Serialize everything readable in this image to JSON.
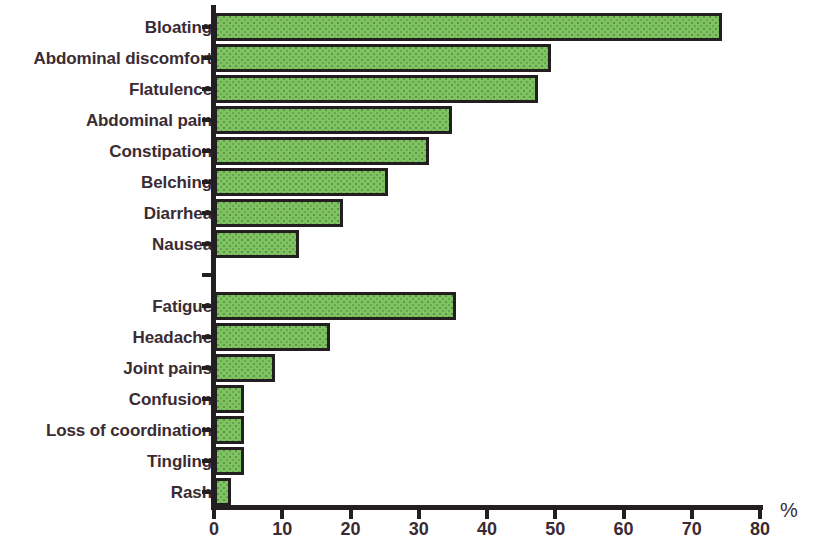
{
  "chart_data": {
    "type": "bar",
    "orientation": "horizontal",
    "title": "",
    "subtitle": "",
    "xlabel": "%",
    "ylabel": "",
    "xlim": [
      0,
      80
    ],
    "xticks": [
      0,
      10,
      20,
      30,
      40,
      50,
      60,
      70,
      80
    ],
    "xtick_labels": [
      "0",
      "10",
      "20",
      "30",
      "40",
      "50",
      "60",
      "70",
      "80"
    ],
    "grid": false,
    "legend": false,
    "bar_color": "#7ec261",
    "bar_edge_color": "#231f20",
    "label_color": "#3b2b33",
    "axis_color": "#231f20",
    "groups": [
      {
        "name": "gastrointestinal-symptoms",
        "categories": [
          "Bloating",
          "Abdominal discomfort",
          "Flatulence",
          "Abdominal pain",
          "Constipation",
          "Belching",
          "Diarrhea",
          "Nausea"
        ],
        "values": [
          74,
          49,
          47,
          34.5,
          31,
          25,
          18.5,
          12
        ]
      },
      {
        "name": "systemic-symptoms",
        "categories": [
          "Fatigue",
          "Headache",
          "Joint pains",
          "Confusion",
          "Loss of coordination",
          "Tingling",
          "Rash"
        ],
        "values": [
          35,
          16.5,
          8.5,
          4,
          4,
          4,
          2
        ]
      }
    ],
    "categories": [
      "Bloating",
      "Abdominal discomfort",
      "Flatulence",
      "Abdominal pain",
      "Constipation",
      "Belching",
      "Diarrhea",
      "Nausea",
      "Fatigue",
      "Headache",
      "Joint pains",
      "Confusion",
      "Loss of coordination",
      "Tingling",
      "Rash"
    ],
    "values": [
      74,
      49,
      47,
      34.5,
      31,
      25,
      18.5,
      12,
      35,
      16.5,
      8.5,
      4,
      4,
      4,
      2
    ]
  }
}
